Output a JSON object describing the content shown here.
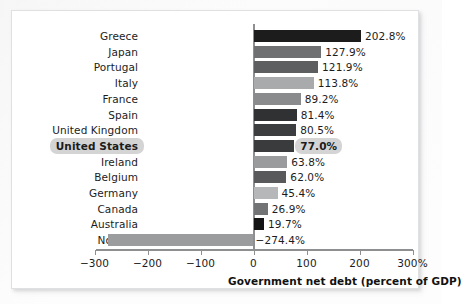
{
  "figure": {
    "background_color": "#ffffff",
    "frame_border_color": "#dfe0e1",
    "axis_color": "#8d8f91",
    "highlight_color": "#d4d4d4",
    "text_color": "#1c1c1c"
  },
  "axis": {
    "title": "Government net debt (percent of GDP)",
    "tick_labels": [
      "−300",
      "−200",
      "−100",
      "0",
      "100",
      "200",
      "300%"
    ],
    "tick_values": [
      -300,
      -200,
      -100,
      0,
      100,
      200,
      300
    ]
  },
  "chart_data": {
    "type": "bar",
    "orientation": "horizontal",
    "title": "",
    "subtitle": "",
    "xlabel": "Government net debt (percent of GDP)",
    "ylabel": "",
    "xlim": [
      -300,
      300
    ],
    "grid": false,
    "legend": null,
    "highlighted_category": "United States",
    "categories": [
      "Greece",
      "Japan",
      "Portugal",
      "Italy",
      "France",
      "Spain",
      "United Kingdom",
      "United States",
      "Ireland",
      "Belgium",
      "Germany",
      "Canada",
      "Australia",
      "Norway"
    ],
    "values": [
      202.8,
      127.9,
      121.9,
      113.8,
      89.2,
      81.4,
      80.5,
      77.0,
      63.8,
      62.0,
      45.4,
      26.9,
      19.7,
      -274.4
    ],
    "value_labels": [
      "202.8%",
      "127.9%",
      "121.9%",
      "113.8%",
      "89.2%",
      "81.4%",
      "80.5%",
      "77.0%",
      "63.8%",
      "62.0%",
      "45.4%",
      "26.9%",
      "19.7%",
      "−274.4%"
    ],
    "bar_colors": [
      "#1c1c1c",
      "#6f7072",
      "#5d5e60",
      "#a9aaac",
      "#8a8b8d",
      "#303133",
      "#3c3d3f",
      "#3a3b3d",
      "#9a9b9d",
      "#59595b",
      "#b6b7b9",
      "#727375",
      "#131314",
      "#9b9c9e"
    ]
  }
}
